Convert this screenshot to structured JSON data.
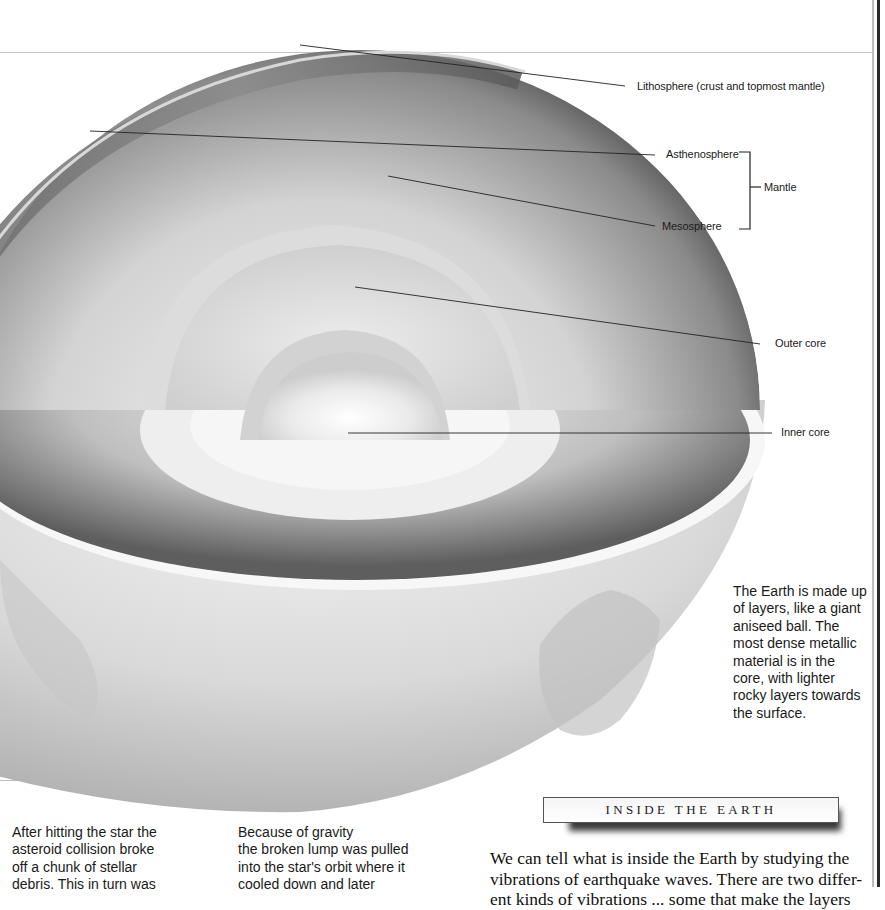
{
  "illustration": {
    "title": "Earth cross-section",
    "labels": {
      "lithosphere": "Lithosphere (crust and topmost mantle)",
      "asthenosphere": "Asthenosphere",
      "mantle": "Mantle",
      "mesosphere": "Mesosphere",
      "outer_core": "Outer core",
      "inner_core": "Inner core"
    }
  },
  "caption": {
    "text": "The Earth is made up of layers, like a giant aniseed ball. The most dense metallic material is in the core, with lighter rocky layers towards the surface.",
    "lines": [
      "The Earth is made up",
      "of layers, like a giant",
      "aniseed ball. The",
      "most dense metallic",
      "material is in the",
      "core, with lighter",
      "rocky layers towards",
      "the surface."
    ]
  },
  "left_column": {
    "lines": [
      "After hitting the star the",
      "asteroid collision broke",
      "off a chunk of stellar",
      "debris. This in turn was"
    ]
  },
  "middle_column": {
    "lines": [
      "Because of gravity",
      "the broken lump was pulled",
      "into the star's orbit where it",
      "cooled down and later"
    ]
  },
  "section": {
    "heading": "INSIDE THE EARTH",
    "body_lines": [
      "We can tell what is inside the Earth by studying the",
      "vibrations of earthquake waves. There are two differ-",
      "ent kinds of vibrations ... some that make the layers"
    ]
  }
}
